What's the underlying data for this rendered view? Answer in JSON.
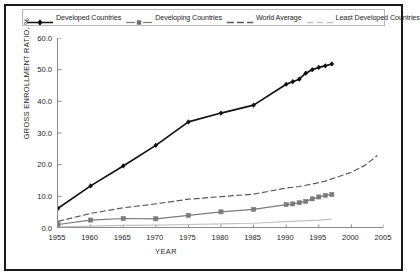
{
  "chart_data": {
    "type": "line",
    "title": "",
    "xlabel": "YEAR",
    "ylabel": "GROSS ENROLLMENT RATIO, %",
    "xlim": [
      1955,
      2005
    ],
    "ylim": [
      0.0,
      60.0
    ],
    "xticks": [
      "1955",
      "1960",
      "1965",
      "1970",
      "1975",
      "1980",
      "1985",
      "1990",
      "1995",
      "2000",
      "2005"
    ],
    "yticks": [
      "0.0",
      "10.0",
      "20.0",
      "30.0",
      "40.0",
      "50.0",
      "60.0"
    ],
    "grid": false,
    "legend_position": "top",
    "series": [
      {
        "name": "Developed Countries",
        "color": "#111111",
        "style": "solid-marker",
        "marker": "diamond",
        "x": [
          1955,
          1960,
          1965,
          1970,
          1975,
          1980,
          1985,
          1990,
          1991,
          1992,
          1993,
          1994,
          1995,
          1996,
          1997
        ],
        "values": [
          6.2,
          13.3,
          19.6,
          26.1,
          33.5,
          36.3,
          38.8,
          45.4,
          46.2,
          47.0,
          48.9,
          50.0,
          50.7,
          51.2,
          51.8
        ]
      },
      {
        "name": "Developing Countries",
        "color": "#7a7a7a",
        "style": "solid-marker",
        "marker": "square",
        "x": [
          1955,
          1960,
          1965,
          1970,
          1975,
          1980,
          1985,
          1990,
          1991,
          1992,
          1993,
          1994,
          1995,
          1996,
          1997
        ],
        "values": [
          1.1,
          2.5,
          3.0,
          2.9,
          4.0,
          5.1,
          5.9,
          7.4,
          7.6,
          8.0,
          8.4,
          9.2,
          9.8,
          10.3,
          10.6
        ]
      },
      {
        "name": "World Average",
        "color": "#5a5a5a",
        "style": "dashed",
        "marker": "none",
        "x": [
          1955,
          1960,
          1965,
          1970,
          1975,
          1980,
          1985,
          1990,
          1992,
          1994,
          1996,
          1998,
          2000,
          2002,
          2004
        ],
        "values": [
          2.1,
          4.6,
          6.4,
          7.6,
          9.1,
          9.9,
          10.7,
          12.6,
          13.1,
          13.9,
          14.8,
          16.2,
          17.6,
          19.7,
          22.9
        ]
      },
      {
        "name": "Least Developed Countries",
        "color": "#c2c2c2",
        "style": "solid-light",
        "marker": "none",
        "x": [
          1955,
          1960,
          1965,
          1970,
          1975,
          1980,
          1985,
          1990,
          1995,
          1997
        ],
        "values": [
          0.4,
          0.6,
          0.8,
          0.9,
          1.1,
          1.3,
          1.5,
          2.0,
          2.5,
          2.8
        ]
      }
    ]
  },
  "legend": {
    "items": [
      {
        "label": "Developed Countries"
      },
      {
        "label": "Developing Countries"
      },
      {
        "label": "World Average"
      },
      {
        "label": "Least Developed Countries"
      }
    ]
  }
}
